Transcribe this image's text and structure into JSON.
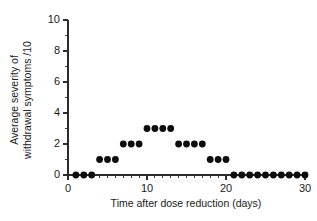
{
  "chart_data": {
    "type": "scatter",
    "title": "",
    "xlabel": "Time after dose reduction (days)",
    "ylabel": "Average severity of\nwithdrawal symptoms /10",
    "ylabel_line1": "Average severity of",
    "ylabel_line2": "withdrawal symptoms /10",
    "xlim": [
      0,
      30
    ],
    "ylim": [
      0,
      10
    ],
    "x_major_ticks": [
      0,
      10,
      20,
      30
    ],
    "x_major_tick_labels": [
      "0",
      "10",
      "20",
      "30"
    ],
    "x_minor_tick_step": 1,
    "y_major_ticks": [
      0,
      2,
      4,
      6,
      8,
      10
    ],
    "y_major_tick_labels": [
      "0",
      "2",
      "4",
      "6",
      "8",
      "10"
    ],
    "y_minor_tick_step": 1,
    "grid": false,
    "legend": null,
    "marker": "filled-circle",
    "marker_color": "#0d0d0d",
    "x": [
      1,
      2,
      3,
      4,
      5,
      6,
      7,
      8,
      9,
      10,
      11,
      12,
      13,
      14,
      15,
      16,
      17,
      18,
      19,
      20,
      21,
      22,
      23,
      24,
      25,
      26,
      27,
      28,
      29,
      30
    ],
    "y": [
      0,
      0,
      0,
      1,
      1,
      1,
      2,
      2,
      2,
      3,
      3,
      3,
      3,
      2,
      2,
      2,
      2,
      1,
      1,
      1,
      0,
      0,
      0,
      0,
      0,
      0,
      0,
      0,
      0,
      0
    ],
    "points": [
      {
        "x": 1,
        "y": 0
      },
      {
        "x": 2,
        "y": 0
      },
      {
        "x": 3,
        "y": 0
      },
      {
        "x": 4,
        "y": 1
      },
      {
        "x": 5,
        "y": 1
      },
      {
        "x": 6,
        "y": 1
      },
      {
        "x": 7,
        "y": 2
      },
      {
        "x": 8,
        "y": 2
      },
      {
        "x": 9,
        "y": 2
      },
      {
        "x": 10,
        "y": 3
      },
      {
        "x": 11,
        "y": 3
      },
      {
        "x": 12,
        "y": 3
      },
      {
        "x": 13,
        "y": 3
      },
      {
        "x": 14,
        "y": 2
      },
      {
        "x": 15,
        "y": 2
      },
      {
        "x": 16,
        "y": 2
      },
      {
        "x": 17,
        "y": 2
      },
      {
        "x": 18,
        "y": 1
      },
      {
        "x": 19,
        "y": 1
      },
      {
        "x": 20,
        "y": 1
      },
      {
        "x": 21,
        "y": 0
      },
      {
        "x": 22,
        "y": 0
      },
      {
        "x": 23,
        "y": 0
      },
      {
        "x": 24,
        "y": 0
      },
      {
        "x": 25,
        "y": 0
      },
      {
        "x": 26,
        "y": 0
      },
      {
        "x": 27,
        "y": 0
      },
      {
        "x": 28,
        "y": 0
      },
      {
        "x": 29,
        "y": 0
      },
      {
        "x": 30,
        "y": 0
      }
    ]
  },
  "colors": {
    "background": "#ffffff",
    "axis": "#2b2b2b",
    "marker": "#0d0d0d",
    "text": "#1a1a1a"
  }
}
